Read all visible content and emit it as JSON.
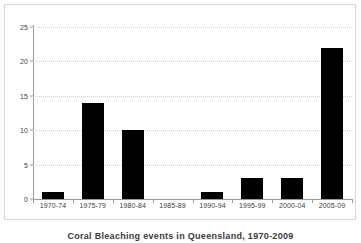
{
  "chart_data": {
    "type": "bar",
    "title": "",
    "caption": "Coral Bleaching events in Queensland, 1970-2009",
    "categories": [
      "1970-74",
      "1975-79",
      "1980-84",
      "1985-89",
      "1990-94",
      "1995-99",
      "2000-04",
      "2005-09"
    ],
    "values": [
      1,
      14,
      10,
      0,
      1,
      3,
      3,
      22
    ],
    "series": [
      {
        "name": "events",
        "values": [
          1,
          14,
          10,
          0,
          1,
          3,
          3,
          22
        ]
      }
    ],
    "xlabel": "",
    "ylabel": "",
    "ylim": [
      0,
      25
    ],
    "y_ticks": [
      0,
      5,
      10,
      15,
      20,
      25
    ],
    "grid": true,
    "grid_axis": "y",
    "grid_style": "dotted",
    "legend": false,
    "legend_position": "none",
    "bar_color": "#000000",
    "background_color": "#ffffff",
    "frame_color": "#d8d8d8",
    "axis_color": "#9a9a9a",
    "gridline_color": "#cfcfcf",
    "tick_label_color": "#404040"
  }
}
